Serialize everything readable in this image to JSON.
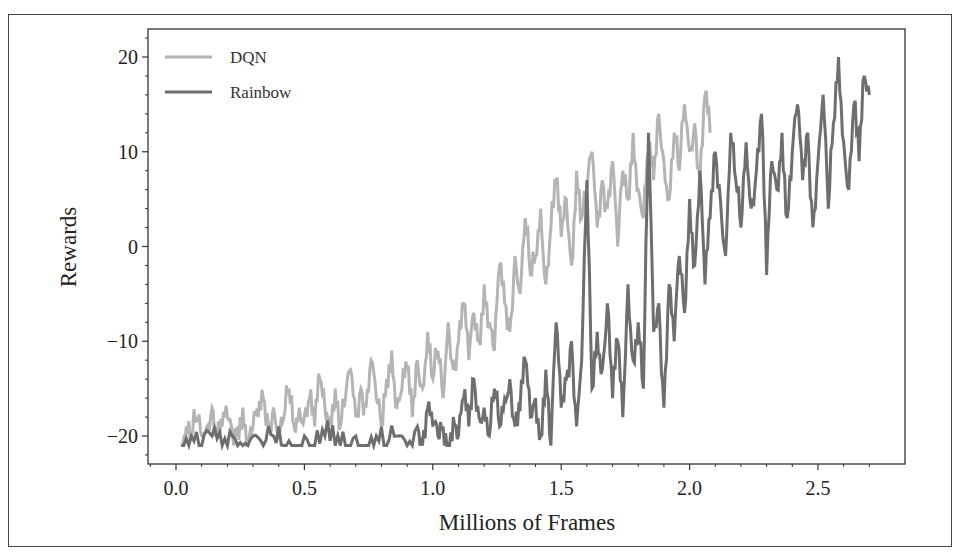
{
  "chart_data": {
    "type": "line",
    "title": "",
    "xlabel": "Millions of Frames",
    "ylabel": "Rewards",
    "xlim": [
      -0.11,
      2.84
    ],
    "ylim": [
      -23,
      23
    ],
    "xticks": [
      0.0,
      0.5,
      1.0,
      1.5,
      2.0,
      2.5
    ],
    "xtick_labels": [
      "0.0",
      "0.5",
      "1.0",
      "1.5",
      "2.0",
      "2.5"
    ],
    "yticks": [
      20,
      10,
      0,
      -10,
      -20
    ],
    "ytick_labels": [
      "20",
      "10",
      "0",
      "−10",
      "−20"
    ],
    "grid": false,
    "legend_position": "upper left",
    "series": [
      {
        "name": "DQN",
        "color": "#b4b4b4",
        "x": [
          0.02,
          0.04,
          0.06,
          0.08,
          0.1,
          0.12,
          0.14,
          0.16,
          0.18,
          0.2,
          0.22,
          0.24,
          0.26,
          0.28,
          0.3,
          0.32,
          0.34,
          0.36,
          0.38,
          0.4,
          0.42,
          0.44,
          0.46,
          0.48,
          0.5,
          0.52,
          0.54,
          0.56,
          0.58,
          0.6,
          0.62,
          0.64,
          0.66,
          0.68,
          0.7,
          0.72,
          0.74,
          0.76,
          0.78,
          0.8,
          0.82,
          0.84,
          0.86,
          0.88,
          0.9,
          0.92,
          0.94,
          0.96,
          0.98,
          1.0,
          1.02,
          1.04,
          1.06,
          1.08,
          1.1,
          1.12,
          1.14,
          1.16,
          1.18,
          1.2,
          1.22,
          1.24,
          1.26,
          1.28,
          1.3,
          1.32,
          1.34,
          1.36,
          1.38,
          1.4,
          1.42,
          1.44,
          1.46,
          1.48,
          1.5,
          1.52,
          1.54,
          1.56,
          1.58,
          1.6,
          1.62,
          1.64,
          1.66,
          1.68,
          1.7,
          1.72,
          1.74,
          1.76,
          1.78,
          1.8,
          1.82,
          1.84,
          1.86,
          1.88,
          1.9,
          1.92,
          1.94,
          1.96,
          1.98,
          2.0,
          2.02,
          2.04,
          2.06,
          2.08
        ],
        "y": [
          -21,
          -19,
          -20,
          -18,
          -20,
          -19,
          -17,
          -20,
          -19,
          -18,
          -20,
          -19,
          -17,
          -21,
          -19,
          -18,
          -16,
          -19,
          -17,
          -20,
          -18,
          -15,
          -19,
          -17,
          -18,
          -16,
          -19,
          -14,
          -17,
          -18,
          -15,
          -19,
          -16,
          -13,
          -18,
          -15,
          -17,
          -12,
          -16,
          -19,
          -14,
          -11,
          -17,
          -15,
          -13,
          -18,
          -12,
          -15,
          -9,
          -14,
          -11,
          -16,
          -8,
          -13,
          -10,
          -6,
          -12,
          -7,
          -10,
          -4,
          -8,
          -11,
          -2,
          -6,
          -9,
          -1,
          -5,
          3,
          -3,
          -1,
          4,
          -4,
          2,
          7,
          1,
          5,
          -2,
          8,
          3,
          6,
          10,
          2,
          7,
          4,
          9,
          0,
          8,
          5,
          12,
          6,
          3,
          10,
          7,
          14,
          9,
          5,
          12,
          8,
          15,
          10,
          13,
          7,
          16,
          12
        ]
      },
      {
        "name": "Rainbow",
        "color": "#6e6e6e",
        "x": [
          0.02,
          0.06,
          0.1,
          0.14,
          0.18,
          0.22,
          0.26,
          0.3,
          0.34,
          0.38,
          0.42,
          0.46,
          0.5,
          0.54,
          0.58,
          0.62,
          0.66,
          0.7,
          0.74,
          0.78,
          0.82,
          0.86,
          0.9,
          0.94,
          0.96,
          0.98,
          1.0,
          1.02,
          1.04,
          1.06,
          1.08,
          1.1,
          1.12,
          1.14,
          1.16,
          1.18,
          1.2,
          1.22,
          1.24,
          1.26,
          1.28,
          1.3,
          1.32,
          1.34,
          1.36,
          1.38,
          1.4,
          1.42,
          1.44,
          1.46,
          1.48,
          1.5,
          1.52,
          1.54,
          1.56,
          1.58,
          1.6,
          1.62,
          1.64,
          1.66,
          1.68,
          1.7,
          1.72,
          1.74,
          1.76,
          1.78,
          1.8,
          1.82,
          1.84,
          1.86,
          1.88,
          1.9,
          1.92,
          1.94,
          1.96,
          1.98,
          2.0,
          2.02,
          2.04,
          2.06,
          2.08,
          2.1,
          2.12,
          2.14,
          2.16,
          2.18,
          2.2,
          2.22,
          2.24,
          2.26,
          2.28,
          2.3,
          2.32,
          2.34,
          2.36,
          2.38,
          2.4,
          2.42,
          2.44,
          2.46,
          2.48,
          2.5,
          2.52,
          2.54,
          2.56,
          2.58,
          2.6,
          2.62,
          2.64,
          2.66,
          2.68,
          2.7
        ],
        "y": [
          -21,
          -20,
          -21,
          -20,
          -21,
          -20,
          -21,
          -20,
          -21,
          -20,
          -21,
          -21,
          -20,
          -21,
          -20,
          -21,
          -21,
          -20,
          -21,
          -20,
          -21,
          -20,
          -21,
          -19,
          -21,
          -17,
          -19,
          -20,
          -19,
          -21,
          -18,
          -20,
          -16,
          -19,
          -14,
          -18,
          -17,
          -20,
          -15,
          -19,
          -16,
          -14,
          -19,
          -17,
          -12,
          -18,
          -16,
          -20,
          -13,
          -21,
          -8,
          -17,
          -14,
          -10,
          -19,
          -12,
          7,
          -15,
          -9,
          -13,
          -6,
          -16,
          -10,
          -18,
          -4,
          -12,
          -8,
          -15,
          12,
          -9,
          -6,
          -17,
          -4,
          -10,
          -1,
          -7,
          5,
          -2,
          8,
          -4,
          3,
          10,
          5,
          -1,
          12,
          7,
          2,
          11,
          4,
          8,
          14,
          -3,
          9,
          6,
          12,
          3,
          10,
          15,
          7,
          12,
          2,
          9,
          16,
          4,
          13,
          20,
          11,
          6,
          15,
          9,
          18,
          16
        ]
      }
    ]
  },
  "legend": {
    "items": [
      {
        "label": "DQN",
        "color": "#b4b4b4"
      },
      {
        "label": "Rainbow",
        "color": "#6e6e6e"
      }
    ]
  }
}
